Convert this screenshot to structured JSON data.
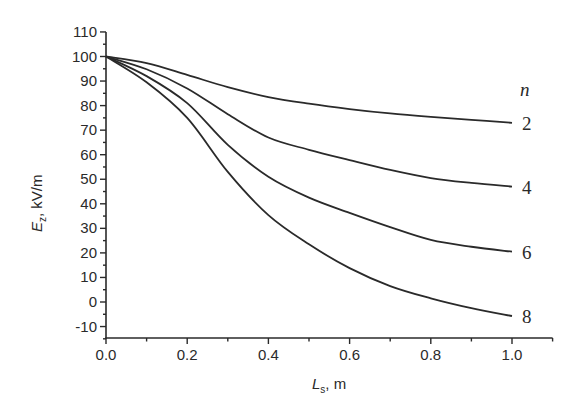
{
  "chart_data": {
    "type": "line",
    "title": "",
    "xlabel": "L_s, m",
    "ylabel": "E_z, kV/m",
    "xlabel_parts": {
      "var": "L",
      "sub": "s",
      "unit": ", m"
    },
    "ylabel_parts": {
      "var": "E",
      "sub": "z",
      "unit": ", kV/m"
    },
    "xlim": [
      0.0,
      1.1
    ],
    "ylim": [
      -15,
      110
    ],
    "x_ticks": [
      0.0,
      0.2,
      0.4,
      0.6,
      0.8,
      1.0
    ],
    "x_tick_labels": [
      "0.0",
      "0.2",
      "0.4",
      "0.6",
      "0.8",
      "1.0"
    ],
    "x_minor_ticks": [
      0.1,
      0.3,
      0.5,
      0.7,
      0.9,
      1.1
    ],
    "y_ticks": [
      -10,
      0,
      10,
      20,
      30,
      40,
      50,
      60,
      70,
      80,
      90,
      100,
      110
    ],
    "y_tick_labels": [
      "-10",
      "0",
      "10",
      "20",
      "30",
      "40",
      "50",
      "60",
      "70",
      "80",
      "90",
      "100",
      "110"
    ],
    "y_minor_ticks": [
      -15,
      -5,
      5,
      15,
      25,
      35,
      45,
      55,
      65,
      75,
      85,
      95,
      105
    ],
    "grid": false,
    "legend_title": "n",
    "legend_position": "right, inline at curve ends",
    "x": [
      0.0,
      0.1,
      0.2,
      0.3,
      0.4,
      0.5,
      0.6,
      0.7,
      0.8,
      0.9,
      1.0
    ],
    "series": [
      {
        "name": "2",
        "values": [
          100,
          97.3,
          92.5,
          87.5,
          83.5,
          80.8,
          78.6,
          76.8,
          75.4,
          74.2,
          73.0
        ]
      },
      {
        "name": "4",
        "values": [
          100,
          94.8,
          87.0,
          76.5,
          67.0,
          62.0,
          57.8,
          53.8,
          50.5,
          48.5,
          47.0
        ]
      },
      {
        "name": "6",
        "values": [
          100,
          92.0,
          81.0,
          64.0,
          51.0,
          42.5,
          36.3,
          30.5,
          25.3,
          22.5,
          20.5
        ]
      },
      {
        "name": "8",
        "values": [
          100,
          89.5,
          75.0,
          53.0,
          35.4,
          23.5,
          13.8,
          6.5,
          1.5,
          -2.5,
          -5.7
        ]
      }
    ]
  },
  "labels": {
    "legend_title": "n",
    "series_labels": [
      "2",
      "4",
      "6",
      "8"
    ]
  }
}
